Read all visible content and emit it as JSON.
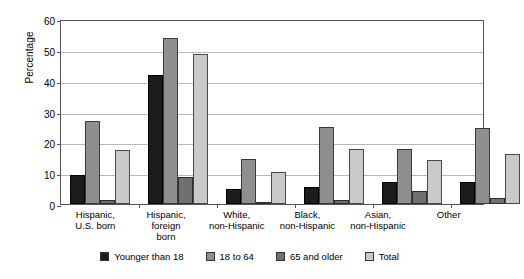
{
  "chart_data": {
    "type": "bar",
    "title": "",
    "xlabel": "",
    "ylabel": "Percentage",
    "ylim": [
      0,
      60
    ],
    "yticks": [
      0,
      10,
      20,
      30,
      40,
      50,
      60
    ],
    "grid": true,
    "legend_position": "bottom",
    "categories": [
      "Hispanic,\nU.S. born",
      "Hispanic,\nforeign\nborn",
      "White,\nnon-Hispanic",
      "Black,\nnon-Hispanic",
      "Asian,\nnon-Hispanic",
      "Other"
    ],
    "series": [
      {
        "name": "Younger than 18",
        "color": "#1c1c1c",
        "values": [
          9.5,
          41.8,
          5.0,
          5.5,
          7.0,
          7.3
        ]
      },
      {
        "name": "18 to 64",
        "color": "#8f8f8f",
        "values": [
          27.0,
          53.7,
          14.5,
          25.0,
          18.0,
          24.5
        ]
      },
      {
        "name": "65 and older",
        "color": "#707070",
        "values": [
          1.2,
          8.7,
          0.7,
          1.3,
          4.3,
          2.0
        ]
      },
      {
        "name": "Total",
        "color": "#c9c9c9",
        "values": [
          17.5,
          48.8,
          10.3,
          17.7,
          14.3,
          16.2
        ]
      }
    ]
  },
  "axis": {
    "y_title": "Percentage",
    "y_tick_labels": [
      "0",
      "10",
      "20",
      "30",
      "40",
      "50",
      "60"
    ],
    "x_tick_labels": [
      "Hispanic,\nU.S. born",
      "Hispanic,\nforeign\nborn",
      "White,\nnon-Hispanic",
      "Black,\nnon-Hispanic",
      "Asian,\nnon-Hispanic",
      "Other"
    ]
  },
  "legend": {
    "items": [
      {
        "label": "Younger than 18",
        "color": "#1c1c1c"
      },
      {
        "label": "18 to 64",
        "color": "#8f8f8f"
      },
      {
        "label": "65 and older",
        "color": "#707070"
      },
      {
        "label": "Total",
        "color": "#c9c9c9"
      }
    ]
  }
}
